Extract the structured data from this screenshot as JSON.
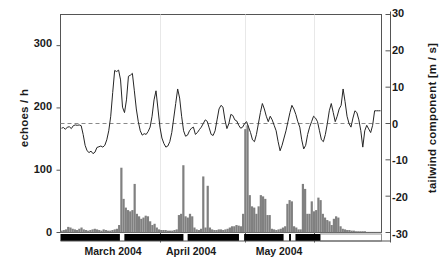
{
  "chart_data": {
    "type": "bar",
    "title": "",
    "subtitle": "",
    "xlabel": "",
    "ylabel": "echoes / h",
    "y2label": "tailwind component [m / s]",
    "ylim": [
      0,
      350
    ],
    "y2lim": [
      -30,
      30
    ],
    "yticks": [
      0,
      100,
      200,
      300
    ],
    "ytick_labels": [
      "0",
      "100",
      "200",
      "300"
    ],
    "y2ticks": [
      -30,
      -20,
      -10,
      0,
      10,
      20,
      30
    ],
    "y2tick_labels": [
      "-30",
      "-20",
      "-10",
      "0",
      "10",
      "20",
      "30"
    ],
    "grid": false,
    "legend": null,
    "x_category_labels": [
      "March 2004",
      "April 2004",
      "May 2004"
    ],
    "x_axis_note": "daily bins, late February 2004 through mid May 2004",
    "zero_reference_line": 0,
    "zero_reference_style": "dashed",
    "series": [
      {
        "name": "echoes / h",
        "type": "bar",
        "axis": "left",
        "color": "#808080",
        "values": [
          3,
          4,
          5,
          9,
          8,
          6,
          5,
          4,
          6,
          8,
          5,
          4,
          3,
          4,
          5,
          6,
          5,
          4,
          3,
          5,
          4,
          3,
          3,
          4,
          5,
          6,
          12,
          104,
          54,
          40,
          36,
          34,
          36,
          78,
          30,
          26,
          22,
          24,
          27,
          26,
          18,
          12,
          14,
          8,
          5,
          4,
          4,
          4,
          3,
          3,
          3,
          4,
          5,
          28,
          30,
          108,
          26,
          24,
          30,
          26,
          8,
          5,
          4,
          6,
          90,
          8,
          75,
          8,
          5,
          4,
          4,
          5,
          5,
          4,
          5,
          6,
          8,
          10,
          10,
          12,
          11,
          10,
          30,
          166,
          172,
          60,
          42,
          40,
          30,
          42,
          60,
          58,
          54,
          28,
          28,
          6,
          5,
          4,
          5,
          6,
          8,
          10,
          46,
          52,
          50,
          10,
          8,
          5,
          5,
          78,
          70,
          30,
          30,
          50,
          34,
          36,
          56,
          52,
          30,
          24,
          20,
          18,
          12,
          22,
          26,
          24,
          10,
          6,
          5,
          4,
          4,
          3,
          3,
          2,
          2,
          2,
          2,
          2,
          1,
          1,
          1,
          1,
          1,
          1,
          1
        ]
      },
      {
        "name": "tailwind component [m / s]",
        "type": "line",
        "axis": "right",
        "color": "#262626",
        "values": [
          -1.3,
          -1.1,
          -1.6,
          -1.0,
          -0.9,
          -1.4,
          -0.6,
          -0.4,
          -0.5,
          -0.4,
          -0.6,
          -3.0,
          -6.0,
          -7.5,
          -8.0,
          -7.6,
          -8.3,
          -7.9,
          -6.6,
          -6.4,
          -6.2,
          -6.5,
          -6.0,
          -4.5,
          -2.0,
          2.0,
          8.5,
          14.6,
          14.3,
          14.7,
          12.0,
          4.5,
          3.0,
          6.5,
          13.0,
          13.3,
          13.8,
          9.0,
          4.0,
          0.5,
          -2.0,
          -3.2,
          -2.8,
          -3.0,
          -2.2,
          -1.0,
          2.0,
          6.5,
          9.0,
          4.0,
          -1.0,
          -4.0,
          -5.5,
          -6.5,
          -6.2,
          -5.0,
          -2.5,
          1.5,
          5.5,
          9.5,
          7.0,
          2.0,
          -2.0,
          -3.5,
          -3.2,
          -2.0,
          -1.3,
          -1.0,
          -3.0,
          -2.5,
          -1.7,
          -1.0,
          0.0,
          1.0,
          0.6,
          -1.2,
          -3.0,
          -3.3,
          -2.0,
          1.0,
          4.0,
          5.0,
          4.5,
          1.0,
          -1.4,
          0.0,
          2.5,
          2.2,
          1.0,
          0.7,
          -0.5,
          -1.3,
          -1.0,
          0.0,
          0.5,
          -1.0,
          -2.5,
          -4.5,
          -5.0,
          -3.0,
          0.0,
          3.0,
          5.5,
          4.0,
          2.0,
          0.5,
          2.0,
          1.0,
          -0.5,
          -2.0,
          -5.0,
          -7.5,
          -6.0,
          -4.0,
          -2.0,
          0.5,
          3.0,
          5.0,
          4.0,
          2.5,
          0.5,
          -1.0,
          -4.5,
          -7.0,
          -6.0,
          -3.0,
          -1.0,
          0.5,
          2.0,
          1.5,
          0.5,
          -2.0,
          -4.5,
          -5.0,
          -3.0,
          0.0,
          3.5,
          5.5,
          3.0,
          0.5,
          2.0,
          4.0,
          5.0,
          9.5,
          6.0,
          2.0,
          0.0,
          -1.0,
          1.5,
          3.5,
          3.0,
          1.0,
          -2.0,
          -6.5,
          -2.0,
          -0.5,
          -1.5,
          -2.5,
          -0.5,
          3.5,
          3.5,
          3.5,
          3.5
        ]
      },
      {
        "name": "observation period bar",
        "type": "interval-bar",
        "axis": "none",
        "color": "#000000",
        "description": "black horizontal bar at baseline with white gaps marking breaks",
        "start_fraction": 0.0,
        "end_fraction": 0.81,
        "gaps": [
          [
            0.185,
            0.199
          ],
          [
            0.383,
            0.396
          ],
          [
            0.556,
            0.572
          ],
          [
            0.695,
            0.712
          ],
          [
            0.718,
            0.732
          ]
        ]
      }
    ],
    "month_tick_fractions": [
      0.3115,
      0.5763,
      0.7913
    ],
    "month_label_fractions": [
      0.196,
      0.438,
      0.712
    ]
  },
  "axes": {
    "left_title": "echoes / h",
    "right_title": "tailwind component [m / s]"
  }
}
